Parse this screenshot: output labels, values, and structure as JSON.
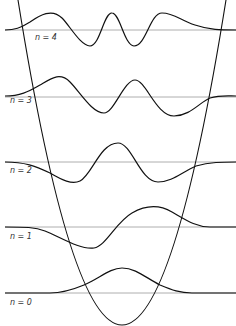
{
  "diagram": {
    "levels": [
      {
        "n": 4,
        "label": "n = 4",
        "baseline_y": 30,
        "label_y": 33
      },
      {
        "n": 3,
        "label": "n = 3",
        "baseline_y": 97,
        "label_y": 100
      },
      {
        "n": 2,
        "label": "n = 2",
        "baseline_y": 162,
        "label_y": 165
      },
      {
        "n": 1,
        "label": "n = 1",
        "baseline_y": 227,
        "label_y": 230
      },
      {
        "n": 0,
        "label": "n = 0",
        "baseline_y": 293,
        "label_y": 296
      }
    ],
    "colors": {
      "curve": "#111111",
      "baseline": "#888888"
    }
  }
}
